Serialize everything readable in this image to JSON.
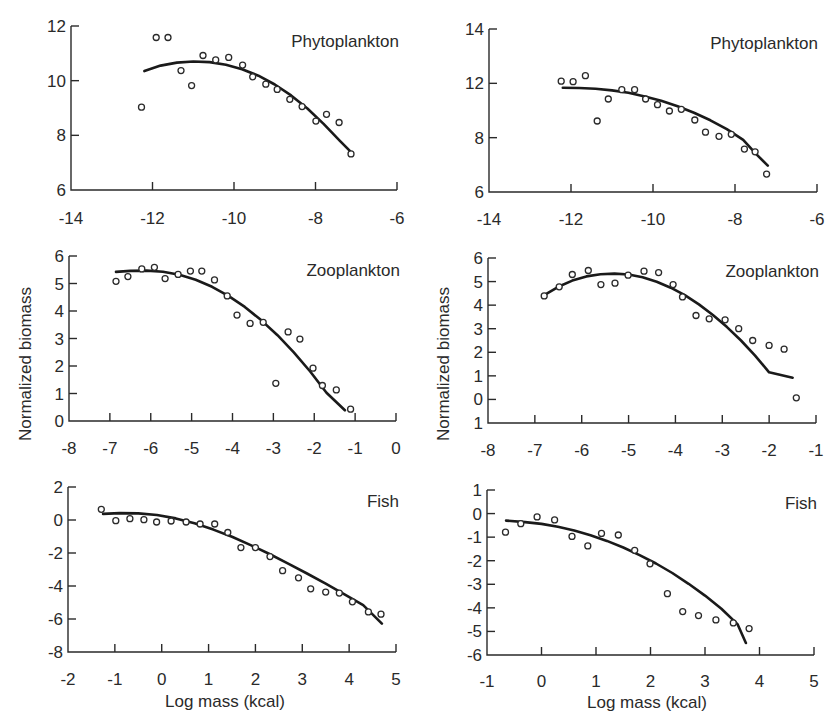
{
  "figure": {
    "y_axis_title": "Normalized biomass",
    "x_axis_title": "Log mass (kcal)"
  },
  "chart_data": [
    {
      "type": "scatter",
      "id": "phyto-left",
      "title": "Phytoplankton",
      "xlabel": "",
      "ylabel": "",
      "xlim": [
        -14,
        -6
      ],
      "ylim": [
        6,
        12
      ],
      "xticks": [
        -14,
        -12,
        -10,
        -8,
        -6
      ],
      "yticks": [
        6,
        8,
        10,
        12
      ],
      "ytick_labels": [
        "6",
        "8",
        "10",
        "12"
      ],
      "grid": false,
      "points": [
        [
          -12.27,
          9.03
        ],
        [
          -11.91,
          11.58
        ],
        [
          -11.62,
          11.58
        ],
        [
          -11.3,
          10.37
        ],
        [
          -11.04,
          9.82
        ],
        [
          -10.76,
          10.92
        ],
        [
          -10.45,
          10.76
        ],
        [
          -10.13,
          10.85
        ],
        [
          -9.79,
          10.57
        ],
        [
          -9.54,
          10.14
        ],
        [
          -9.22,
          9.87
        ],
        [
          -8.94,
          9.68
        ],
        [
          -8.63,
          9.32
        ],
        [
          -8.33,
          9.05
        ],
        [
          -7.99,
          8.52
        ],
        [
          -7.73,
          8.77
        ],
        [
          -7.42,
          8.47
        ],
        [
          -7.13,
          7.32
        ]
      ],
      "fit": [
        [
          -12.2,
          10.35
        ],
        [
          -11.8,
          10.55
        ],
        [
          -11.4,
          10.66
        ],
        [
          -11.0,
          10.7
        ],
        [
          -10.6,
          10.68
        ],
        [
          -10.2,
          10.58
        ],
        [
          -9.8,
          10.42
        ],
        [
          -9.4,
          10.18
        ],
        [
          -9.0,
          9.86
        ],
        [
          -8.6,
          9.46
        ],
        [
          -8.2,
          8.98
        ],
        [
          -7.8,
          8.42
        ],
        [
          -7.4,
          7.8
        ],
        [
          -7.15,
          7.42
        ]
      ]
    },
    {
      "type": "scatter",
      "id": "phyto-right",
      "title": "Phytoplankton",
      "xlabel": "",
      "ylabel": "",
      "xlim": [
        -14,
        -6
      ],
      "ylim": [
        6,
        14
      ],
      "xticks": [
        -14,
        -12,
        -10,
        -8,
        -6
      ],
      "yticks": [
        6,
        8,
        12,
        14
      ],
      "ytick_labels": [
        "6",
        "8",
        "12",
        "14"
      ],
      "note": "y tick labels as printed (evenly spaced ticks labeled 6, 8, 12, 14)",
      "grid": false,
      "points": [
        [
          -12.24,
          12.08
        ],
        [
          -11.95,
          12.06
        ],
        [
          -11.65,
          12.28
        ],
        [
          -11.36,
          9.23
        ],
        [
          -11.09,
          10.85
        ],
        [
          -10.76,
          11.53
        ],
        [
          -10.45,
          11.53
        ],
        [
          -10.18,
          10.85
        ],
        [
          -9.89,
          10.43
        ],
        [
          -9.6,
          9.96
        ],
        [
          -9.31,
          10.09
        ],
        [
          -8.98,
          9.3
        ],
        [
          -8.72,
          8.4
        ],
        [
          -8.39,
          8.1
        ],
        [
          -8.09,
          8.25
        ],
        [
          -7.77,
          7.58
        ],
        [
          -7.51,
          7.48
        ],
        [
          -7.23,
          6.66
        ]
      ],
      "fit": [
        [
          -12.2,
          11.68
        ],
        [
          -11.8,
          11.66
        ],
        [
          -11.4,
          11.6
        ],
        [
          -11.0,
          11.48
        ],
        [
          -10.6,
          11.3
        ],
        [
          -10.2,
          11.04
        ],
        [
          -9.8,
          10.72
        ],
        [
          -9.4,
          10.32
        ],
        [
          -9.0,
          9.84
        ],
        [
          -8.6,
          9.28
        ],
        [
          -8.2,
          8.62
        ],
        [
          -7.8,
          7.92
        ],
        [
          -7.5,
          7.42
        ],
        [
          -7.2,
          6.97
        ]
      ]
    },
    {
      "type": "scatter",
      "id": "zoo-left",
      "title": "Zooplankton",
      "xlabel": "",
      "ylabel": "Normalized biomass",
      "xlim": [
        -8,
        0
      ],
      "ylim": [
        0,
        6
      ],
      "xticks": [
        -8,
        -7,
        -6,
        -5,
        -4,
        -3,
        -2,
        -1,
        0
      ],
      "yticks": [
        0,
        1,
        2,
        3,
        4,
        5,
        6
      ],
      "ytick_labels": [
        "0",
        "1",
        "2",
        "3",
        "4",
        "5",
        "6"
      ],
      "grid": false,
      "points": [
        [
          -6.85,
          5.08
        ],
        [
          -6.56,
          5.25
        ],
        [
          -6.22,
          5.53
        ],
        [
          -5.91,
          5.59
        ],
        [
          -5.65,
          5.18
        ],
        [
          -5.33,
          5.33
        ],
        [
          -5.03,
          5.45
        ],
        [
          -4.75,
          5.45
        ],
        [
          -4.44,
          5.13
        ],
        [
          -4.13,
          4.55
        ],
        [
          -3.89,
          3.85
        ],
        [
          -3.57,
          3.55
        ],
        [
          -3.25,
          3.59
        ],
        [
          -2.94,
          1.37
        ],
        [
          -2.64,
          3.24
        ],
        [
          -2.35,
          2.98
        ],
        [
          -2.03,
          1.92
        ],
        [
          -1.8,
          1.29
        ],
        [
          -1.46,
          1.13
        ],
        [
          -1.11,
          0.43
        ]
      ],
      "fit": [
        [
          -6.85,
          5.42
        ],
        [
          -6.5,
          5.46
        ],
        [
          -6.1,
          5.47
        ],
        [
          -5.7,
          5.43
        ],
        [
          -5.3,
          5.32
        ],
        [
          -4.9,
          5.14
        ],
        [
          -4.5,
          4.88
        ],
        [
          -4.1,
          4.55
        ],
        [
          -3.7,
          4.15
        ],
        [
          -3.3,
          3.67
        ],
        [
          -2.9,
          3.12
        ],
        [
          -2.5,
          2.5
        ],
        [
          -2.1,
          1.8
        ],
        [
          -1.7,
          1.03
        ],
        [
          -1.25,
          0.39
        ]
      ]
    },
    {
      "type": "scatter",
      "id": "zoo-right",
      "title": "Zooplankton",
      "xlabel": "",
      "ylabel": "Normalized biomass",
      "xlim": [
        -8,
        -1
      ],
      "ylim": [
        -1,
        6
      ],
      "xticks": [
        -8,
        -7,
        -6,
        -5,
        -4,
        -3,
        -2,
        -1
      ],
      "yticks": [
        -1,
        0,
        1,
        2,
        3,
        4,
        5,
        6
      ],
      "ytick_labels": [
        "1",
        "0",
        "1",
        "2",
        "3",
        "4",
        "5",
        "6"
      ],
      "note": "bottom tick printed as '1' (minus sign missing)",
      "grid": false,
      "points": [
        [
          -6.8,
          4.39
        ],
        [
          -6.48,
          4.78
        ],
        [
          -6.2,
          5.3
        ],
        [
          -5.86,
          5.47
        ],
        [
          -5.59,
          4.87
        ],
        [
          -5.29,
          4.93
        ],
        [
          -5.01,
          5.27
        ],
        [
          -4.67,
          5.44
        ],
        [
          -4.36,
          5.38
        ],
        [
          -4.05,
          4.87
        ],
        [
          -3.85,
          4.35
        ],
        [
          -3.56,
          3.56
        ],
        [
          -3.28,
          3.42
        ],
        [
          -2.94,
          3.38
        ],
        [
          -2.65,
          3.0
        ],
        [
          -2.35,
          2.5
        ],
        [
          -2.0,
          2.29
        ],
        [
          -1.68,
          2.13
        ],
        [
          -1.42,
          0.07
        ]
      ],
      "fit": [
        [
          -6.8,
          4.42
        ],
        [
          -6.5,
          4.78
        ],
        [
          -6.2,
          5.04
        ],
        [
          -5.9,
          5.22
        ],
        [
          -5.6,
          5.31
        ],
        [
          -5.3,
          5.34
        ],
        [
          -5.0,
          5.3
        ],
        [
          -4.7,
          5.18
        ],
        [
          -4.4,
          4.99
        ],
        [
          -4.1,
          4.74
        ],
        [
          -3.8,
          4.42
        ],
        [
          -3.5,
          4.03
        ],
        [
          -3.2,
          3.58
        ],
        [
          -2.9,
          3.07
        ],
        [
          -2.6,
          2.5
        ],
        [
          -2.3,
          1.86
        ],
        [
          -2.0,
          1.15
        ],
        [
          -1.5,
          0.92
        ]
      ]
    },
    {
      "type": "scatter",
      "id": "fish-left",
      "title": "Fish",
      "xlabel": "Log mass (kcal)",
      "ylabel": "",
      "xlim": [
        -2,
        5
      ],
      "ylim": [
        -8,
        2
      ],
      "xticks": [
        -2,
        -1,
        0,
        1,
        2,
        3,
        4,
        5
      ],
      "yticks": [
        -8,
        -6,
        -4,
        -2,
        0,
        2
      ],
      "ytick_labels": [
        "-8",
        "-6",
        "-4",
        "-2",
        "0",
        "2"
      ],
      "grid": false,
      "points": [
        [
          -1.29,
          0.65
        ],
        [
          -0.98,
          -0.04
        ],
        [
          -0.68,
          0.08
        ],
        [
          -0.38,
          0.02
        ],
        [
          -0.11,
          -0.12
        ],
        [
          0.2,
          -0.06
        ],
        [
          0.52,
          -0.12
        ],
        [
          0.82,
          -0.24
        ],
        [
          1.13,
          -0.24
        ],
        [
          1.41,
          -0.76
        ],
        [
          1.69,
          -1.67
        ],
        [
          2.0,
          -1.67
        ],
        [
          2.31,
          -2.22
        ],
        [
          2.58,
          -3.07
        ],
        [
          2.92,
          -3.5
        ],
        [
          3.18,
          -4.17
        ],
        [
          3.5,
          -4.37
        ],
        [
          3.79,
          -4.43
        ],
        [
          4.07,
          -4.96
        ],
        [
          4.41,
          -5.57
        ],
        [
          4.68,
          -5.71
        ]
      ],
      "fit": [
        [
          -1.25,
          0.37
        ],
        [
          -0.9,
          0.42
        ],
        [
          -0.5,
          0.4
        ],
        [
          -0.1,
          0.3
        ],
        [
          0.3,
          0.1
        ],
        [
          0.7,
          -0.2
        ],
        [
          1.1,
          -0.58
        ],
        [
          1.5,
          -1.02
        ],
        [
          1.9,
          -1.52
        ],
        [
          2.3,
          -2.06
        ],
        [
          2.7,
          -2.64
        ],
        [
          3.1,
          -3.24
        ],
        [
          3.5,
          -3.86
        ],
        [
          3.9,
          -4.5
        ],
        [
          4.3,
          -5.16
        ],
        [
          4.7,
          -6.28
        ]
      ]
    },
    {
      "type": "scatter",
      "id": "fish-right",
      "title": "Fish",
      "xlabel": "Log mass (kcal)",
      "ylabel": "",
      "xlim": [
        -1,
        5
      ],
      "ylim": [
        -6,
        1
      ],
      "xticks": [
        -1,
        0,
        1,
        2,
        3,
        4,
        5
      ],
      "yticks": [
        -6,
        -5,
        -4,
        -3,
        -2,
        -1,
        0,
        1
      ],
      "ytick_labels": [
        "-6",
        "-5",
        "-4",
        "-3",
        "-2",
        "-1",
        "0",
        "1"
      ],
      "grid": false,
      "points": [
        [
          -0.66,
          -0.79
        ],
        [
          -0.38,
          -0.43
        ],
        [
          -0.08,
          -0.14
        ],
        [
          0.24,
          -0.27
        ],
        [
          0.56,
          -0.97
        ],
        [
          0.85,
          -1.37
        ],
        [
          1.1,
          -0.84
        ],
        [
          1.41,
          -0.91
        ],
        [
          1.71,
          -1.56
        ],
        [
          1.99,
          -2.13
        ],
        [
          2.31,
          -3.4
        ],
        [
          2.59,
          -4.16
        ],
        [
          2.88,
          -4.33
        ],
        [
          3.2,
          -4.51
        ],
        [
          3.52,
          -4.64
        ],
        [
          3.81,
          -4.88
        ]
      ],
      "fit": [
        [
          -0.65,
          -0.3
        ],
        [
          -0.3,
          -0.36
        ],
        [
          0.0,
          -0.44
        ],
        [
          0.3,
          -0.56
        ],
        [
          0.6,
          -0.72
        ],
        [
          0.9,
          -0.92
        ],
        [
          1.2,
          -1.16
        ],
        [
          1.5,
          -1.44
        ],
        [
          1.8,
          -1.76
        ],
        [
          2.1,
          -2.12
        ],
        [
          2.4,
          -2.52
        ],
        [
          2.7,
          -2.98
        ],
        [
          3.0,
          -3.48
        ],
        [
          3.3,
          -4.04
        ],
        [
          3.6,
          -4.7
        ],
        [
          3.75,
          -5.49
        ]
      ]
    }
  ],
  "layout": {
    "panels": [
      {
        "left": 71,
        "right": 397,
        "top": 26,
        "bottom": 190,
        "title_x": 399,
        "title_y": 47,
        "xlab_y": 218,
        "ylab_x": 60
      },
      {
        "left": 489,
        "right": 817,
        "top": 29,
        "bottom": 192,
        "title_x": 818,
        "title_y": 49,
        "xlab_y": 219,
        "ylab_x": 478
      },
      {
        "left": 69,
        "right": 396,
        "top": 256,
        "bottom": 421,
        "title_x": 400,
        "title_y": 276,
        "xlab_y": 448,
        "ylab_x": 58
      },
      {
        "left": 488,
        "right": 816,
        "top": 258,
        "bottom": 423,
        "title_x": 819,
        "title_y": 277,
        "xlab_y": 450,
        "ylab_x": 477
      },
      {
        "left": 68,
        "right": 396,
        "top": 487,
        "bottom": 652,
        "title_x": 399,
        "title_y": 507,
        "xlab_y": 679,
        "ylab_x": 57
      },
      {
        "left": 487,
        "right": 814,
        "top": 490,
        "bottom": 655,
        "title_x": 817,
        "title_y": 509,
        "xlab_y": 681,
        "ylab_x": 476
      }
    ],
    "y_title_left": {
      "x": 31,
      "y": 364
    },
    "y_title_right": {
      "x": 449,
      "y": 364
    },
    "x_title_left": {
      "x": 225,
      "y": 707
    },
    "x_title_right": {
      "x": 647,
      "y": 708
    }
  }
}
